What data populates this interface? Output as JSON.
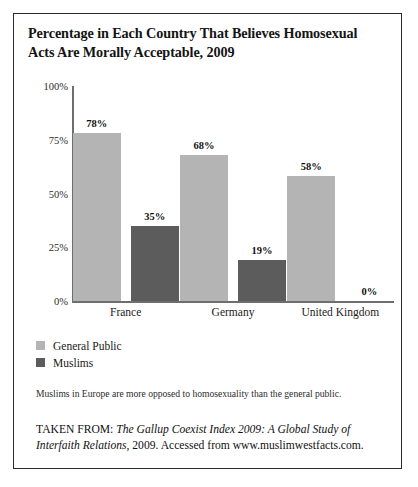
{
  "figure": {
    "title": "Percentage in Each Country That Believes Homosexual Acts Are Morally Acceptable, 2009",
    "caption": "Muslims in Europe are more opposed to homosexuality than the general public.",
    "source_prefix": "TAKEN FROM:",
    "source_title": "The Gallup Coexist Index 2009: A Global Study of Interfaith Relations",
    "source_rest": ", 2009. Accessed from www.muslimwestfacts.com."
  },
  "chart_data": {
    "type": "bar",
    "title": "Percentage in Each Country That Believes Homosexual Acts Are Morally Acceptable, 2009",
    "xlabel": "",
    "ylabel": "",
    "ylim": [
      0,
      100
    ],
    "yticks": [
      0,
      25,
      50,
      75,
      100
    ],
    "ytick_labels": [
      "0%",
      "25%",
      "50%",
      "75%",
      "100%"
    ],
    "grid": false,
    "legend_position": "below-left",
    "categories": [
      "France",
      "Germany",
      "United Kingdom"
    ],
    "series": [
      {
        "name": "General Public",
        "color": "#b4b4b4",
        "values": [
          78,
          68,
          58
        ],
        "value_labels": [
          "78%",
          "68%",
          "58%"
        ]
      },
      {
        "name": "Muslims",
        "color": "#5c5c5c",
        "values": [
          35,
          19,
          0
        ],
        "value_labels": [
          "35%",
          "19%",
          "0%"
        ]
      }
    ]
  }
}
